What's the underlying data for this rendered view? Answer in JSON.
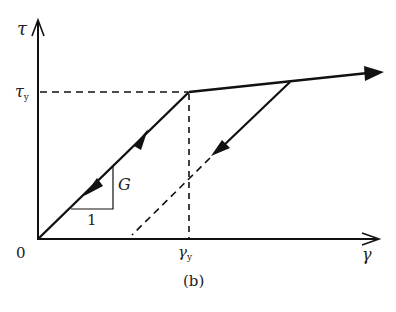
{
  "figure": {
    "caption": "(b)",
    "type": "bilinear elastic-plastic shear stress-strain diagram"
  },
  "axes": {
    "y_label": "τ",
    "x_label": "γ",
    "origin_label": "0",
    "y_tick_symbol": "τ",
    "y_tick_sub": "y",
    "x_tick_symbol": "γ",
    "x_tick_sub": "y"
  },
  "slope_triangle": {
    "rise_label": "G",
    "run_label": "1"
  },
  "curves": [
    {
      "name": "elastic-loading",
      "style": "solid",
      "direction": "both (loading up, unloading down)"
    },
    {
      "name": "strain-hardening",
      "style": "solid",
      "direction": "outward"
    },
    {
      "name": "elastic-unloading",
      "style": "solid then dashed",
      "direction": "down"
    },
    {
      "name": "yield-stress-reference",
      "style": "dashed"
    },
    {
      "name": "yield-strain-reference",
      "style": "dashed"
    }
  ],
  "colors": {
    "ink": "#111111",
    "background": "#ffffff"
  }
}
